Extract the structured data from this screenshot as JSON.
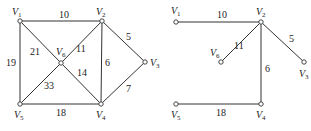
{
  "graphs": [
    {
      "name": "original-graph",
      "nodes": [
        {
          "id": "V1",
          "label": "V",
          "sub": "1",
          "x": 20,
          "y": 21,
          "lx": 12,
          "ly": 15
        },
        {
          "id": "V2",
          "label": "V",
          "sub": "2",
          "x": 102,
          "y": 21,
          "lx": 96,
          "ly": 15
        },
        {
          "id": "V3",
          "label": "V",
          "sub": "3",
          "x": 145,
          "y": 62,
          "lx": 150,
          "ly": 66
        },
        {
          "id": "V4",
          "label": "V",
          "sub": "4",
          "x": 101,
          "y": 104,
          "lx": 96,
          "ly": 118
        },
        {
          "id": "V5",
          "label": "V",
          "sub": "5",
          "x": 20,
          "y": 104,
          "lx": 14,
          "ly": 118
        },
        {
          "id": "V6",
          "label": "V",
          "sub": "6",
          "x": 61,
          "y": 63,
          "lx": 56,
          "ly": 55
        }
      ],
      "edges": [
        {
          "from": "V1",
          "to": "V2",
          "w": "10",
          "wx": 59,
          "wy": 18
        },
        {
          "from": "V1",
          "to": "V5",
          "w": "19",
          "wx": 6,
          "wy": 66
        },
        {
          "from": "V1",
          "to": "V6",
          "w": "21",
          "wx": 30,
          "wy": 55
        },
        {
          "from": "V2",
          "to": "V6",
          "w": "11",
          "wx": 76,
          "wy": 52
        },
        {
          "from": "V2",
          "to": "V4",
          "w": "6",
          "wx": 105,
          "wy": 66
        },
        {
          "from": "V2",
          "to": "V3",
          "w": "5",
          "wx": 126,
          "wy": 40
        },
        {
          "from": "V6",
          "to": "V4",
          "w": "14",
          "wx": 77,
          "wy": 76
        },
        {
          "from": "V6",
          "to": "V5",
          "w": "33",
          "wx": 44,
          "wy": 89
        },
        {
          "from": "V5",
          "to": "V4",
          "w": "18",
          "wx": 56,
          "wy": 116
        },
        {
          "from": "V3",
          "to": "V4",
          "w": "7",
          "wx": 126,
          "wy": 92
        }
      ]
    },
    {
      "name": "spanning-tree",
      "nodes": [
        {
          "id": "V1",
          "label": "V",
          "sub": "1",
          "x": 176,
          "y": 22,
          "lx": 171,
          "ly": 14
        },
        {
          "id": "V2",
          "label": "V",
          "sub": "2",
          "x": 261,
          "y": 22,
          "lx": 256,
          "ly": 15
        },
        {
          "id": "V3",
          "label": "V",
          "sub": "3",
          "x": 304,
          "y": 62,
          "lx": 299,
          "ly": 77
        },
        {
          "id": "V4",
          "label": "V",
          "sub": "4",
          "x": 261,
          "y": 104,
          "lx": 256,
          "ly": 118
        },
        {
          "id": "V5",
          "label": "V",
          "sub": "5",
          "x": 176,
          "y": 104,
          "lx": 171,
          "ly": 118
        },
        {
          "id": "V6",
          "label": "V",
          "sub": "6",
          "x": 221,
          "y": 62,
          "lx": 210,
          "ly": 56
        }
      ],
      "edges": [
        {
          "from": "V1",
          "to": "V2",
          "w": "10",
          "wx": 217,
          "wy": 18
        },
        {
          "from": "V2",
          "to": "V6",
          "w": "11",
          "wx": 234,
          "wy": 49
        },
        {
          "from": "V2",
          "to": "V3",
          "w": "5",
          "wx": 289,
          "wy": 42
        },
        {
          "from": "V2",
          "to": "V4",
          "w": "6",
          "wx": 265,
          "wy": 72
        },
        {
          "from": "V5",
          "to": "V4",
          "w": "18",
          "wx": 216,
          "wy": 116
        }
      ]
    }
  ]
}
